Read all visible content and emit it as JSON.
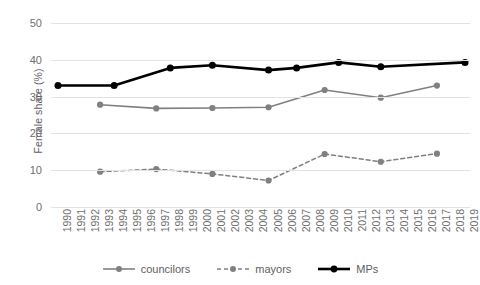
{
  "chart_data": {
    "type": "line",
    "title": "",
    "xlabel": "",
    "ylabel": "Female share (%)",
    "ylim": [
      0,
      50
    ],
    "yticks": [
      0,
      10,
      20,
      30,
      40,
      50
    ],
    "ytick_labels": [
      "0",
      "10",
      "20",
      "30",
      "40",
      "50"
    ],
    "grid": true,
    "legend_position": "bottom",
    "x": [
      1990,
      1991,
      1992,
      1993,
      1994,
      1995,
      1996,
      1997,
      1998,
      1999,
      2000,
      2001,
      2002,
      2003,
      2004,
      2005,
      2006,
      2007,
      2008,
      2009,
      2010,
      2011,
      2012,
      2013,
      2014,
      2015,
      2016,
      2017,
      2018,
      2019
    ],
    "xtick_labels": [
      "1990",
      "1991",
      "1992",
      "1993",
      "1994",
      "1995",
      "1996",
      "1997",
      "1998",
      "1999",
      "2000",
      "2001",
      "2002",
      "2003",
      "2004",
      "2005",
      "2006",
      "2007",
      "2008",
      "2009",
      "2010",
      "2011",
      "2012",
      "2013",
      "2014",
      "2015",
      "2016",
      "2017",
      "2018",
      "2019"
    ],
    "series": [
      {
        "name": "councilors",
        "color": "#808080",
        "linestyle": "solid",
        "linewidth": 1.6,
        "marker": "circle",
        "points": [
          {
            "x": 1993,
            "y": 27.8
          },
          {
            "x": 1997,
            "y": 26.8
          },
          {
            "x": 2001,
            "y": 26.9
          },
          {
            "x": 2005,
            "y": 27.1
          },
          {
            "x": 2009,
            "y": 31.8
          },
          {
            "x": 2013,
            "y": 29.7
          },
          {
            "x": 2017,
            "y": 33.0
          }
        ]
      },
      {
        "name": "mayors",
        "color": "#808080",
        "linestyle": "dashed",
        "linewidth": 1.5,
        "marker": "circle",
        "points": [
          {
            "x": 1993,
            "y": 9.6
          },
          {
            "x": 1997,
            "y": 10.3
          },
          {
            "x": 2001,
            "y": 9.0
          },
          {
            "x": 2005,
            "y": 7.2
          },
          {
            "x": 2009,
            "y": 14.4
          },
          {
            "x": 2013,
            "y": 12.3
          },
          {
            "x": 2017,
            "y": 14.5
          }
        ]
      },
      {
        "name": "MPs",
        "color": "#000000",
        "linestyle": "solid",
        "linewidth": 2.6,
        "marker": "circle",
        "points": [
          {
            "x": 1990,
            "y": 33.0
          },
          {
            "x": 1994,
            "y": 33.0
          },
          {
            "x": 1998,
            "y": 37.8
          },
          {
            "x": 2001,
            "y": 38.5
          },
          {
            "x": 2005,
            "y": 37.2
          },
          {
            "x": 2007,
            "y": 37.8
          },
          {
            "x": 2010,
            "y": 39.3
          },
          {
            "x": 2013,
            "y": 38.1
          },
          {
            "x": 2019,
            "y": 39.3
          }
        ]
      }
    ]
  },
  "legend": {
    "items": [
      {
        "label": "councilors"
      },
      {
        "label": "mayors"
      },
      {
        "label": "MPs"
      }
    ]
  },
  "colors": {
    "grid": "#e2e2e2",
    "axis_text": "#6e6e6e",
    "gray_series": "#808080",
    "black_series": "#000000",
    "background": "#ffffff"
  }
}
